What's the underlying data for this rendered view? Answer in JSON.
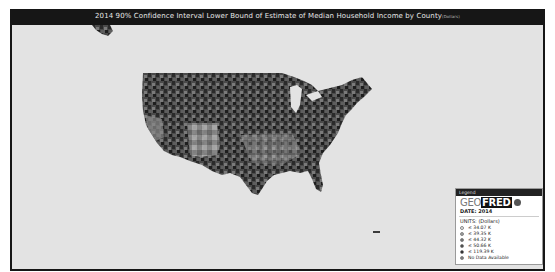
{
  "title": {
    "main": "2014 90% Confidence Interval Lower Bound of Estimate of Median Household Income by County",
    "units_suffix": "(Dollars)"
  },
  "map": {
    "region": "United States counties",
    "colors": {
      "background": "#e3e3e3",
      "frame": "#161616"
    }
  },
  "legend": {
    "header": "Legend",
    "logo_geo": "GEO",
    "logo_fred": "FRED",
    "date_label": "DATE: 2014",
    "units_label": "UNITS:  (Dollars)",
    "items": [
      {
        "label": "≤ 34.07 K",
        "color": "#e6e6e6"
      },
      {
        "label": "≤ 39.35 K",
        "color": "#9a9a9a"
      },
      {
        "label": "≤ 44.32 K",
        "color": "#6a6a6a"
      },
      {
        "label": "≤ 50.66 K",
        "color": "#3a3a3a"
      },
      {
        "label": "≤ 119.39 K",
        "color": "#111111"
      },
      {
        "label": "No Data Available",
        "color": "#777777"
      }
    ]
  }
}
